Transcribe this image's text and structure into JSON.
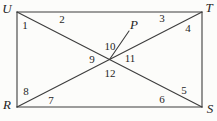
{
  "figure": {
    "background": "#fcfcfa",
    "line_color": "#3d3d3d",
    "lines": [
      {
        "name": "side-UT",
        "x1": 17,
        "y1": 12,
        "x2": 202,
        "y2": 12
      },
      {
        "name": "side-TS",
        "x1": 202,
        "y1": 12,
        "x2": 202,
        "y2": 107
      },
      {
        "name": "side-RS",
        "x1": 17,
        "y1": 107,
        "x2": 202,
        "y2": 107
      },
      {
        "name": "side-UR",
        "x1": 17,
        "y1": 12,
        "x2": 17,
        "y2": 107
      },
      {
        "name": "diagonal-US",
        "x1": 17,
        "y1": 12,
        "x2": 202,
        "y2": 107
      },
      {
        "name": "diagonal-RT",
        "x1": 17,
        "y1": 107,
        "x2": 202,
        "y2": 12
      },
      {
        "name": "ray-to-P",
        "x1": 109.5,
        "y1": 59.5,
        "x2": 129,
        "y2": 31
      }
    ],
    "vertices": [
      {
        "label": "U",
        "x": 7,
        "y": 8
      },
      {
        "label": "T",
        "x": 209,
        "y": 7
      },
      {
        "label": "R",
        "x": 7,
        "y": 104
      },
      {
        "label": "S",
        "x": 210,
        "y": 108
      }
    ],
    "point": {
      "label": "P",
      "x": 134,
      "y": 24
    },
    "angles": [
      {
        "label": "1",
        "x": 25,
        "y": 25
      },
      {
        "label": "2",
        "x": 62,
        "y": 19
      },
      {
        "label": "3",
        "x": 162,
        "y": 18
      },
      {
        "label": "4",
        "x": 188,
        "y": 28
      },
      {
        "label": "5",
        "x": 184,
        "y": 90
      },
      {
        "label": "6",
        "x": 162,
        "y": 99
      },
      {
        "label": "7",
        "x": 51,
        "y": 100
      },
      {
        "label": "8",
        "x": 26,
        "y": 91
      },
      {
        "label": "9",
        "x": 92,
        "y": 59
      },
      {
        "label": "10",
        "x": 110,
        "y": 46
      },
      {
        "label": "11",
        "x": 130,
        "y": 58
      },
      {
        "label": "12",
        "x": 110,
        "y": 73
      }
    ]
  }
}
